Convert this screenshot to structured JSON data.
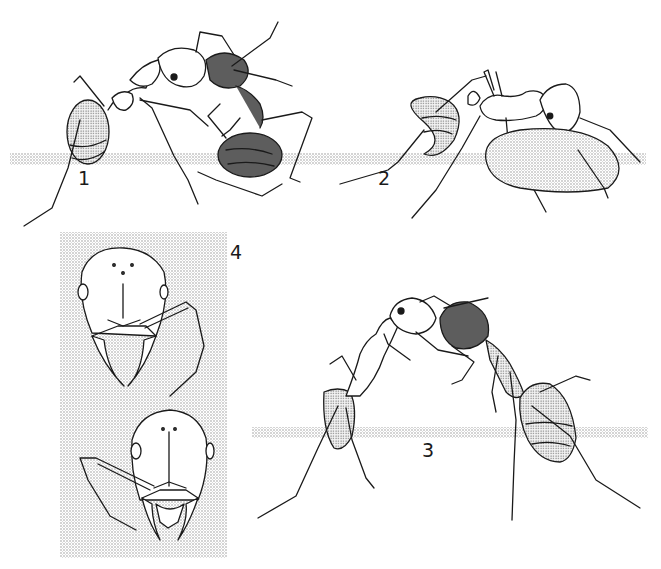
{
  "plate": {
    "panels": [
      {
        "id": "1",
        "label": "1",
        "description": "Two ants interacting; one ant grasping another from above"
      },
      {
        "id": "2",
        "label": "2",
        "description": "Ant carrying a large seed or droplet beneath its head"
      },
      {
        "id": "3",
        "label": "3",
        "description": "Two ants facing each other with heads touching, arched posture"
      },
      {
        "id": "4",
        "label": "4",
        "description": "Frontal views of two ant heads showing mandibles and antennae"
      }
    ]
  },
  "colors": {
    "ink": "#1a1a1a",
    "stipple": "#b8b8b8",
    "background": "#ffffff"
  }
}
